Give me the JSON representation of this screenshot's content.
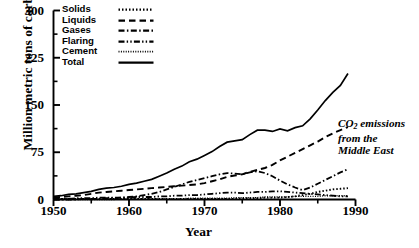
{
  "chart_data": {
    "type": "line",
    "title": "",
    "xlabel": "Year",
    "ylabel": "Million metric tons of carbon",
    "xlim": [
      1950,
      1990
    ],
    "ylim": [
      0,
      300
    ],
    "ytick_labels": [
      "300",
      "225",
      "150",
      "75",
      "0"
    ],
    "ytick_values": [
      300,
      225,
      150,
      75,
      0
    ],
    "yminor_step": 37.5,
    "xtick_labels": [
      "1950",
      "1960",
      "1970",
      "1980",
      "1990"
    ],
    "xtick_values": [
      1950,
      1960,
      1970,
      1980,
      1990
    ],
    "xminor_step": 5,
    "grid": false,
    "legend_position": "top-left-inside",
    "annotation": "CO2 emissions from the Middle East",
    "annotation_lines": [
      "CO",
      "2",
      " emissions",
      "from the",
      "Middle East"
    ],
    "x": [
      1950,
      1951,
      1952,
      1953,
      1954,
      1955,
      1956,
      1957,
      1958,
      1959,
      1960,
      1961,
      1962,
      1963,
      1964,
      1965,
      1966,
      1967,
      1968,
      1969,
      1970,
      1971,
      1972,
      1973,
      1974,
      1975,
      1976,
      1977,
      1978,
      1979,
      1980,
      1981,
      1982,
      1983,
      1984,
      1985,
      1986,
      1987,
      1988,
      1989
    ],
    "series": [
      {
        "name": "Solids",
        "style": "dotted",
        "values": [
          1,
          1,
          1,
          1,
          1,
          1,
          1,
          1,
          1,
          1,
          1,
          1,
          1,
          1,
          1,
          1,
          1,
          1,
          1,
          1,
          1,
          1,
          1,
          1,
          1,
          2,
          2,
          2,
          3,
          3,
          3,
          4,
          5,
          7,
          9,
          12,
          14,
          16,
          17,
          18
        ]
      },
      {
        "name": "Liquids",
        "style": "dashed",
        "values": [
          3,
          4,
          5,
          6,
          7,
          9,
          11,
          12,
          13,
          14,
          15,
          16,
          17,
          18,
          19,
          20,
          21,
          22,
          23,
          24,
          26,
          29,
          32,
          36,
          38,
          40,
          44,
          47,
          50,
          55,
          62,
          68,
          74,
          80,
          86,
          92,
          99,
          105,
          110,
          115
        ]
      },
      {
        "name": "Gases",
        "style": "dashdot",
        "values": [
          0,
          0,
          0,
          0,
          1,
          1,
          1,
          2,
          2,
          3,
          4,
          5,
          7,
          9,
          12,
          16,
          20,
          24,
          28,
          31,
          34,
          37,
          40,
          42,
          41,
          40,
          43,
          45,
          42,
          37,
          30,
          24,
          19,
          15,
          19,
          25,
          31,
          37,
          43,
          48
        ]
      },
      {
        "name": "Flaring",
        "style": "dashdotdot",
        "values": [
          1,
          1,
          1,
          2,
          2,
          2,
          3,
          3,
          3,
          3,
          3,
          4,
          4,
          4,
          5,
          5,
          6,
          6,
          7,
          7,
          8,
          9,
          10,
          11,
          11,
          10,
          11,
          12,
          12,
          13,
          13,
          12,
          11,
          10,
          9,
          8,
          7,
          6,
          5,
          5
        ]
      },
      {
        "name": "Cement",
        "style": "finedotted",
        "values": [
          0,
          0,
          0,
          0,
          0,
          0,
          0,
          0,
          0,
          1,
          1,
          1,
          1,
          1,
          1,
          1,
          1,
          1,
          2,
          2,
          2,
          2,
          2,
          2,
          3,
          3,
          3,
          3,
          4,
          4,
          4,
          4,
          5,
          5,
          5,
          5,
          6,
          6,
          6,
          6
        ]
      },
      {
        "name": "Total",
        "style": "solid",
        "values": [
          5,
          6,
          8,
          9,
          11,
          13,
          16,
          18,
          19,
          21,
          24,
          26,
          29,
          32,
          37,
          42,
          48,
          53,
          60,
          64,
          70,
          76,
          84,
          91,
          93,
          95,
          103,
          110,
          110,
          108,
          112,
          109,
          114,
          117,
          128,
          142,
          157,
          170,
          181,
          200
        ]
      }
    ]
  },
  "legend": {
    "items": [
      {
        "label": "Solids",
        "style": "dotted"
      },
      {
        "label": "Liquids",
        "style": "dashed"
      },
      {
        "label": "Gases",
        "style": "dashdot"
      },
      {
        "label": "Flaring",
        "style": "dashdotdot"
      },
      {
        "label": "Cement",
        "style": "finedotted"
      },
      {
        "label": "Total",
        "style": "solid"
      }
    ]
  },
  "axes": {
    "ylabel": "Million metric tons of carbon",
    "xlabel": "Year",
    "ytick_labels": [
      "300",
      "225",
      "150",
      "75",
      "0"
    ],
    "xtick_labels": [
      "1950",
      "1960",
      "1970",
      "1980",
      "1990"
    ]
  },
  "annotation": {
    "line1_pre": "CO",
    "line1_sub": "2",
    "line1_post": " emissions",
    "line2": "from the",
    "line3": "Middle East"
  },
  "colors": {
    "ink": "#000000",
    "background": "#ffffff"
  }
}
